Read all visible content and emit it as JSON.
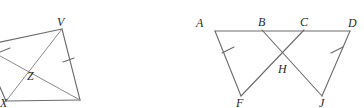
{
  "image": {
    "width": 364,
    "height": 108,
    "background": "#ffffff",
    "stroke_color": "#6b6b6b",
    "label_color": "#2b2b2b",
    "description": "Two geometry diagrams side by side"
  },
  "figures": [
    {
      "id": "left-figure",
      "name": "quadrilateral-with-diagonals",
      "note": "Quadrilateral partially cropped at the left edge; diagonals intersect at Z",
      "vertices": [
        {
          "label": "V",
          "x": 62,
          "y": 29,
          "lx": 57,
          "ly": 24
        },
        {
          "label": "X",
          "x": 6,
          "y": 101,
          "lx": 1,
          "ly": 106
        },
        {
          "label": "Z",
          "x": 31,
          "y": 68,
          "lx": 27,
          "ly": 80
        }
      ],
      "labels": {
        "v": "V",
        "x": "X",
        "z": "Z"
      },
      "ticks": [
        {
          "name": "tick-upper-left-side"
        },
        {
          "name": "tick-lower-right-side"
        }
      ]
    },
    {
      "id": "right-figure",
      "name": "two-triangles-sharing-baseline",
      "note": "Segment A-D on top with triangle AF and triangle DJ; BJ and CF cross at H",
      "vertices": [
        {
          "label": "A",
          "x": 215,
          "y": 31,
          "lx": 196,
          "ly": 25
        },
        {
          "label": "B",
          "x": 262,
          "y": 30,
          "lx": 259,
          "ly": 24
        },
        {
          "label": "C",
          "x": 304,
          "y": 30,
          "lx": 301,
          "ly": 24
        },
        {
          "label": "D",
          "x": 350,
          "y": 31,
          "lx": 349,
          "ly": 25
        },
        {
          "label": "F",
          "x": 241,
          "y": 96,
          "lx": 237,
          "ly": 105
        },
        {
          "label": "J",
          "x": 322,
          "y": 96,
          "lx": 320,
          "ly": 105
        },
        {
          "label": "H",
          "x": 281,
          "y": 59,
          "lx": 279,
          "ly": 71
        }
      ],
      "labels": {
        "a": "A",
        "b": "B",
        "c": "C",
        "d": "D",
        "f": "F",
        "j": "J",
        "h": "H"
      },
      "ticks": [
        {
          "name": "tick-segment-af"
        },
        {
          "name": "tick-segment-dj"
        }
      ]
    }
  ]
}
